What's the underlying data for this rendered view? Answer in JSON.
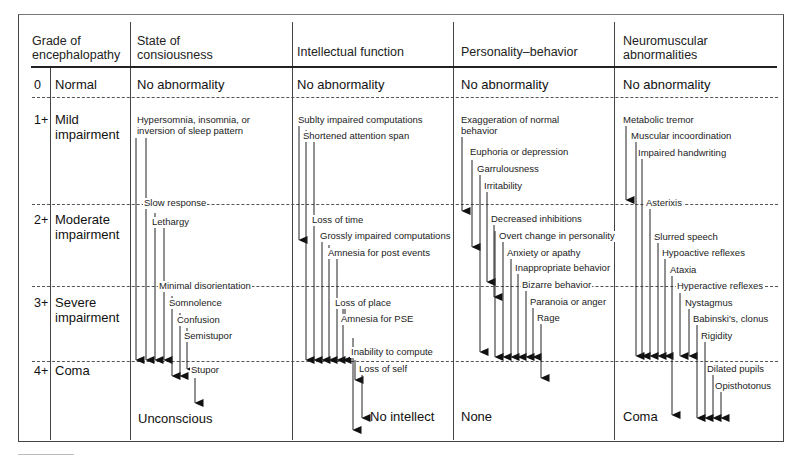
{
  "headers": {
    "grade": "Grade of\nencephalopathy",
    "grade_line1": "Grade of",
    "grade_line2": "encephalopathy",
    "consciousness_line1": "State of",
    "consciousness_line2": "consiousness",
    "intellect": "Intellectual function",
    "personality": "Personality–behavior",
    "neuro_line1": "Neuromuscular",
    "neuro_line2": "abnormalities"
  },
  "grades": [
    {
      "num": "0",
      "label_line1": "Normal",
      "label_line2": ""
    },
    {
      "num": "1+",
      "label_line1": "Mild",
      "label_line2": "impairment"
    },
    {
      "num": "2+",
      "label_line1": "Moderate",
      "label_line2": "impairment"
    },
    {
      "num": "3+",
      "label_line1": "Severe",
      "label_line2": "impairment"
    },
    {
      "num": "4+",
      "label_line1": "Coma",
      "label_line2": ""
    }
  ],
  "normal_row": {
    "consciousness": "No abnormality",
    "intellect": "No abnormality",
    "personality": "No abnormality",
    "neuro": "No abnormality"
  },
  "end_row": {
    "consciousness": "Unconscious",
    "intellect": "No intellect",
    "personality": "None",
    "neuro": "Coma"
  },
  "consciousness_items": [
    "Hypersomnia, insomnia, or",
    "inversion of sleep pattern",
    "Slow response",
    "Lethargy",
    "Minimal disorientation",
    "Somnolence",
    "Confusion",
    "Semistupor",
    "Stupor"
  ],
  "intellect_items": [
    "Sublty impaired computations",
    "Shortened attention span",
    "Loss of time",
    "Grossly impaired computations",
    "Amnesia for post events",
    "Loss of place",
    "Amnesia for PSE",
    "Inability to compute",
    "Loss of self"
  ],
  "personality_items": [
    "Exaggeration of normal",
    "behavior",
    "Euphoria or depression",
    "Garrulousness",
    "Irritability",
    "Decreased inhibitions",
    "Overt change in personality",
    "Anxiety or apathy",
    "Inappropriate behavior",
    "Bizarre behavior",
    "Paranoia or anger",
    "Rage"
  ],
  "neuro_items": [
    "Metabolic tremor",
    "Muscular incoordination",
    "Impaired handwriting",
    "Asterixis",
    "Slurred speech",
    "Hypoactive reflexes",
    "Ataxia",
    "Hyperactive reflexes",
    "Nystagmus",
    "Babinski's, clonus",
    "Rigidity",
    "Dilated pupils",
    "Opisthotonus"
  ]
}
